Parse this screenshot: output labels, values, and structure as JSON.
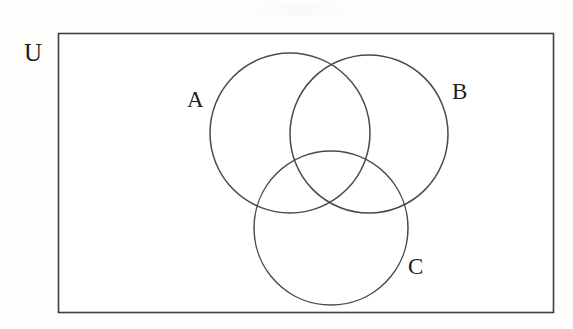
{
  "diagram": {
    "type": "venn-diagram",
    "universe": {
      "label": "U",
      "shape": "rectangle",
      "x": 58,
      "y": 33,
      "width": 495,
      "height": 279,
      "stroke_color": "#3f3f3f",
      "fill_color": "#ffffff",
      "label_position": "outside-top-left"
    },
    "background_color": "#fdfdfc",
    "stroke_color": "#4a4a4a",
    "sets": [
      {
        "label": "A",
        "shape": "circle",
        "cx": 290,
        "cy": 133,
        "r": 80,
        "label_x": 196,
        "label_y": 100,
        "label_position": "left-outside"
      },
      {
        "label": "B",
        "shape": "circle",
        "cx": 369,
        "cy": 134,
        "r": 79,
        "label_x": 461,
        "label_y": 92,
        "label_position": "right-outside"
      },
      {
        "label": "C",
        "shape": "circle",
        "cx": 331,
        "cy": 228,
        "r": 77,
        "label_x": 417,
        "label_y": 267,
        "label_position": "right-outside"
      }
    ]
  }
}
